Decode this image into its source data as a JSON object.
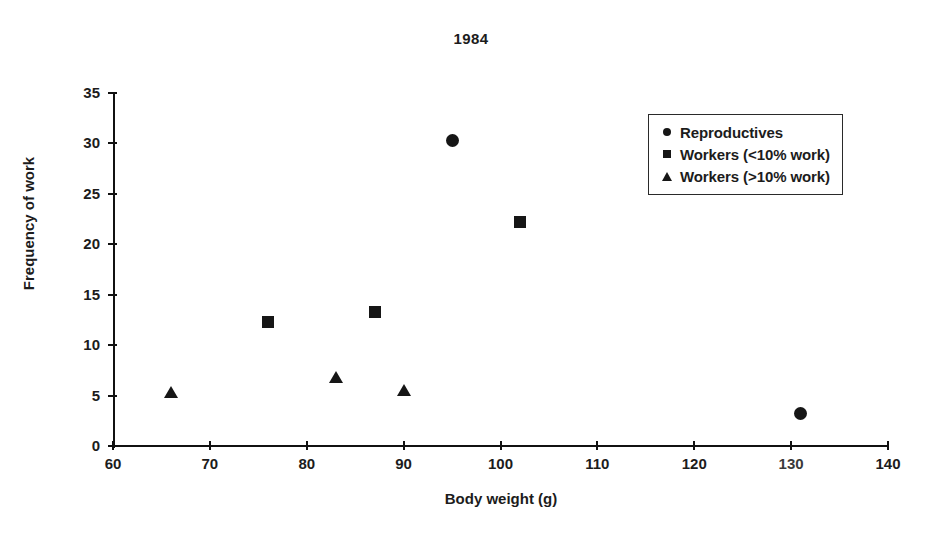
{
  "chart_data": {
    "type": "scatter",
    "title": "1984",
    "xlabel": "Body weight (g)",
    "ylabel": "Frequency of work",
    "xlim": [
      60,
      140
    ],
    "ylim": [
      0,
      35
    ],
    "xticks": [
      60,
      70,
      80,
      90,
      100,
      110,
      120,
      130,
      140
    ],
    "yticks": [
      0,
      5,
      10,
      15,
      20,
      25,
      30,
      35
    ],
    "grid": false,
    "legend_position": "upper-right",
    "series": [
      {
        "name": "Reproductives",
        "marker": "circle",
        "color": "#161616",
        "points": [
          {
            "x": 95,
            "y": 30.3
          },
          {
            "x": 131,
            "y": 3.2
          }
        ]
      },
      {
        "name": "Workers (<10% work)",
        "marker": "square",
        "color": "#161616",
        "points": [
          {
            "x": 76,
            "y": 12.3
          },
          {
            "x": 87,
            "y": 13.3
          },
          {
            "x": 102,
            "y": 22.2
          }
        ]
      },
      {
        "name": "Workers (>10% work)",
        "marker": "triangle",
        "color": "#161616",
        "points": [
          {
            "x": 66,
            "y": 5.4
          },
          {
            "x": 83,
            "y": 6.8
          },
          {
            "x": 90,
            "y": 5.6
          }
        ]
      }
    ]
  }
}
